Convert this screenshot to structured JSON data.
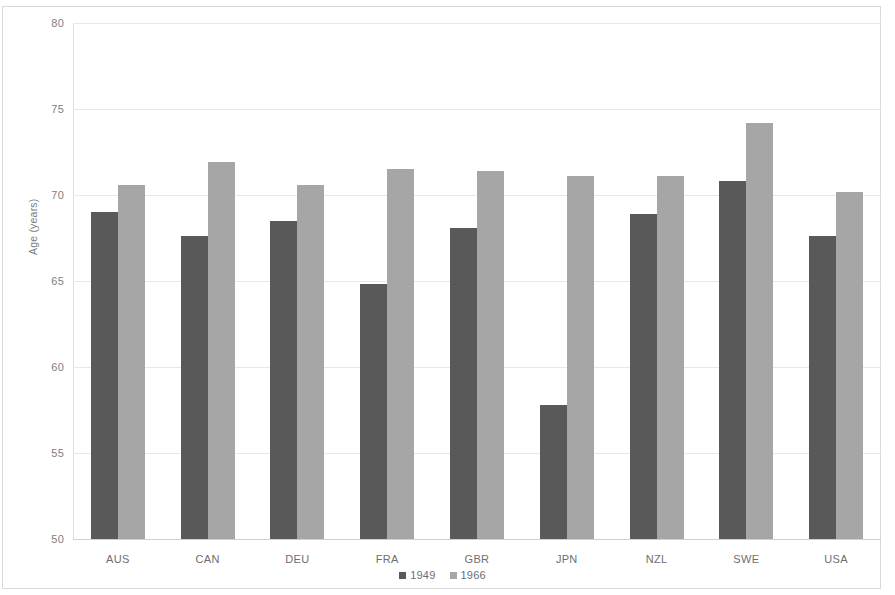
{
  "chart_data": {
    "type": "bar",
    "title": "",
    "subtitle": "",
    "xlabel": "",
    "ylabel": "Age (years)",
    "categories": [
      "AUS",
      "CAN",
      "DEU",
      "FRA",
      "GBR",
      "JPN",
      "NZL",
      "SWE",
      "USA"
    ],
    "series": [
      {
        "name": "1949",
        "color": "#595959",
        "values": [
          69.0,
          67.6,
          68.5,
          64.8,
          68.1,
          57.8,
          68.9,
          70.8,
          67.6
        ]
      },
      {
        "name": "1966",
        "color": "#a6a6a6",
        "values": [
          70.6,
          71.9,
          70.6,
          71.5,
          71.4,
          71.1,
          71.1,
          74.2,
          70.2
        ]
      }
    ],
    "ylim": [
      50,
      80
    ],
    "yticks": [
      50,
      55,
      60,
      65,
      70,
      75,
      80
    ],
    "ytick_labels": [
      "50",
      "55",
      "60",
      "65",
      "70",
      "75",
      "80"
    ],
    "grid": true,
    "grid_axis": "y",
    "legend": {
      "position": "bottom-center",
      "entries": [
        {
          "label": "1949",
          "color": "#595959"
        },
        {
          "label": "1966",
          "color": "#a6a6a6"
        }
      ]
    },
    "background": "#ffffff",
    "border_color": "#d9d9d9"
  }
}
